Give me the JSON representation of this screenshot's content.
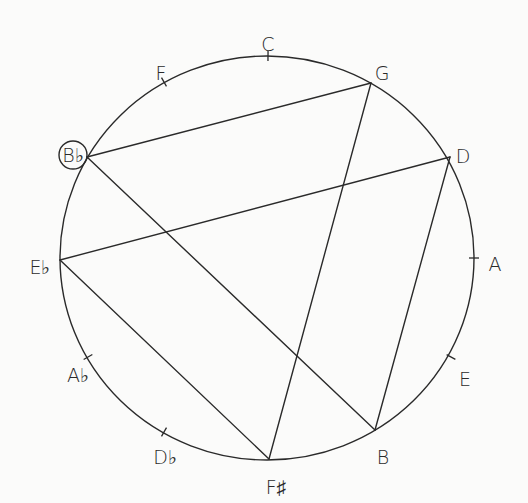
{
  "diagram": {
    "circle": {
      "cx": 267,
      "cy": 258,
      "rx": 207,
      "ry": 202
    },
    "notes": [
      {
        "name": "C",
        "label": "C",
        "x": 268,
        "y": 56,
        "lx": 268,
        "ly": 44,
        "anchor": "middle",
        "tick": true,
        "circled": false
      },
      {
        "name": "G",
        "label": "G",
        "x": 371,
        "y": 83,
        "lx": 382,
        "ly": 73,
        "anchor": "middle",
        "tick": false,
        "circled": false
      },
      {
        "name": "D",
        "label": "D",
        "x": 450,
        "y": 157,
        "lx": 463,
        "ly": 156,
        "anchor": "middle",
        "tick": false,
        "circled": false
      },
      {
        "name": "A",
        "label": "A",
        "x": 474,
        "y": 258,
        "lx": 495,
        "ly": 264,
        "anchor": "middle",
        "tick": true,
        "circled": false
      },
      {
        "name": "E",
        "label": "E",
        "x": 451,
        "y": 357,
        "lx": 465,
        "ly": 379,
        "anchor": "middle",
        "tick": true,
        "circled": false
      },
      {
        "name": "B",
        "label": "B",
        "x": 375,
        "y": 430,
        "lx": 383,
        "ly": 457,
        "anchor": "middle",
        "tick": false,
        "circled": false
      },
      {
        "name": "F#",
        "label": "F♯",
        "x": 269,
        "y": 459,
        "lx": 276,
        "ly": 487,
        "anchor": "middle",
        "tick": false,
        "circled": false
      },
      {
        "name": "Db",
        "label": "D♭",
        "x": 164,
        "y": 432,
        "lx": 165,
        "ly": 457,
        "anchor": "middle",
        "tick": true,
        "circled": false
      },
      {
        "name": "Ab",
        "label": "A♭",
        "x": 88,
        "y": 357,
        "lx": 78,
        "ly": 375,
        "anchor": "middle",
        "tick": true,
        "circled": false
      },
      {
        "name": "Eb",
        "label": "E♭",
        "x": 60,
        "y": 260,
        "lx": 40,
        "ly": 267,
        "anchor": "middle",
        "tick": false,
        "circled": false
      },
      {
        "name": "Bb",
        "label": "B♭",
        "x": 87,
        "y": 157,
        "lx": 73,
        "ly": 155,
        "anchor": "middle",
        "tick": false,
        "circled": true
      },
      {
        "name": "F",
        "label": "F",
        "x": 164,
        "y": 82,
        "lx": 161,
        "ly": 73,
        "anchor": "middle",
        "tick": true,
        "circled": false
      }
    ],
    "lines": [
      {
        "from": "Bb",
        "to": "G"
      },
      {
        "from": "Eb",
        "to": "D"
      },
      {
        "from": "Bb",
        "to": "B"
      },
      {
        "from": "Eb",
        "to": "F#"
      },
      {
        "from": "G",
        "to": "F#"
      },
      {
        "from": "D",
        "to": "B"
      }
    ]
  }
}
